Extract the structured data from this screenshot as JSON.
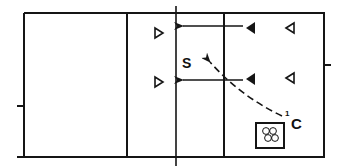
{
  "diagram": {
    "type": "volleyball-court-drill",
    "colors": {
      "line": "#151515",
      "background": "#ffffff"
    },
    "labels": {
      "setter": "S",
      "coach": "C",
      "coach_sequence": "1"
    },
    "players": {
      "left_side_open_right_facing": [
        {
          "x": 158,
          "y": 33,
          "icon": "open-triangle-right"
        },
        {
          "x": 158,
          "y": 82,
          "icon": "open-triangle-right"
        }
      ],
      "right_side_filled_left_facing": [
        {
          "x": 250,
          "y": 28,
          "icon": "filled-triangle-left"
        },
        {
          "x": 250,
          "y": 79,
          "icon": "filled-triangle-left"
        }
      ],
      "right_side_open_left_facing": [
        {
          "x": 290,
          "y": 28,
          "icon": "open-triangle-left"
        },
        {
          "x": 290,
          "y": 78,
          "icon": "open-triangle-left"
        }
      ]
    },
    "movements": [
      {
        "type": "solid-arrow",
        "from": [
          243,
          26
        ],
        "to": [
          182,
          26
        ]
      },
      {
        "type": "solid-arrow",
        "from": [
          243,
          80
        ],
        "to": [
          182,
          80
        ]
      },
      {
        "type": "dashed-arrow",
        "from": [
          282,
          116
        ],
        "to": [
          209,
          61
        ]
      }
    ],
    "equipment": {
      "ball_cart": {
        "icon": "ball-cart-icon",
        "balls": 4
      }
    }
  }
}
